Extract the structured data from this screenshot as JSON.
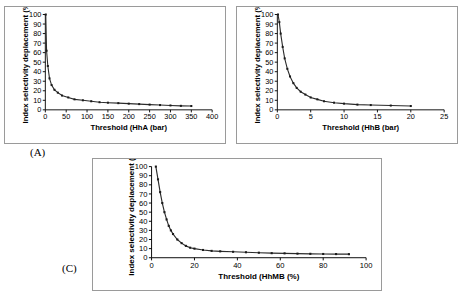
{
  "figure": {
    "panels": [
      {
        "key": "A",
        "label": "(A)",
        "chart": {
          "type": "line",
          "title": "",
          "xlabel": "Threshold  (HhA (bar)",
          "ylabel": "Index selectivity deplacement (%)",
          "xlim": [
            0,
            400
          ],
          "ylim": [
            0,
            100
          ],
          "xticks": [
            0,
            50,
            100,
            150,
            200,
            250,
            300,
            350,
            400
          ],
          "yticks": [
            0,
            10,
            20,
            30,
            40,
            50,
            60,
            70,
            80,
            90,
            100
          ],
          "grid": false,
          "legend": "none",
          "x": [
            1,
            3,
            6,
            10,
            15,
            22,
            30,
            40,
            55,
            70,
            90,
            110,
            130,
            150,
            175,
            200,
            225,
            250,
            275,
            300,
            325,
            350
          ],
          "y": [
            100,
            62,
            46,
            33,
            26,
            21,
            18,
            15,
            13,
            11,
            10,
            9,
            8,
            7.5,
            7,
            6.5,
            6,
            5.5,
            5,
            4.6,
            4.2,
            4
          ]
        }
      },
      {
        "key": "B",
        "label": "",
        "chart": {
          "type": "line",
          "title": "",
          "xlabel": "Threshold  (HhB (bar)",
          "ylabel": "Index selectivity deplacement (%)",
          "xlim": [
            0,
            25
          ],
          "ylim": [
            0,
            100
          ],
          "xticks": [
            0,
            5,
            10,
            15,
            20,
            25
          ],
          "yticks": [
            0,
            10,
            20,
            30,
            40,
            50,
            60,
            70,
            80,
            90,
            100
          ],
          "grid": false,
          "legend": "none",
          "x": [
            0.1,
            0.3,
            0.5,
            0.8,
            1.1,
            1.5,
            1.9,
            2.4,
            2.9,
            3.5,
            4.2,
            5,
            6,
            7,
            8.5,
            10,
            12,
            14,
            17,
            20
          ],
          "y": [
            100,
            92,
            80,
            66,
            54,
            43,
            35,
            28,
            23,
            19,
            16,
            13,
            11,
            9,
            7.5,
            6.5,
            5.5,
            5,
            4.5,
            4
          ]
        }
      },
      {
        "key": "C",
        "label": "(C)",
        "chart": {
          "type": "line",
          "title": "",
          "xlabel": "Threshold  (HhMB (%)",
          "ylabel": "Index selectivity deplacement (%)",
          "xlim": [
            0,
            100
          ],
          "ylim": [
            0,
            100
          ],
          "xticks": [
            0,
            20,
            40,
            60,
            80,
            100
          ],
          "yticks": [
            0,
            10,
            20,
            30,
            40,
            50,
            60,
            70,
            80,
            90,
            100
          ],
          "grid": false,
          "legend": "none",
          "x": [
            2,
            3,
            4,
            5,
            6,
            7,
            8,
            9,
            10,
            12,
            14,
            16,
            18,
            20,
            24,
            28,
            32,
            38,
            44,
            50,
            56,
            62,
            68,
            74,
            80,
            86,
            92
          ],
          "y": [
            100,
            86,
            72,
            60,
            50,
            42,
            35,
            30,
            26,
            20,
            16,
            13,
            11,
            10,
            8.5,
            7.5,
            7,
            6.5,
            6,
            5.5,
            5,
            4.8,
            4.5,
            4.3,
            4.1,
            4,
            3.9
          ]
        }
      }
    ]
  }
}
